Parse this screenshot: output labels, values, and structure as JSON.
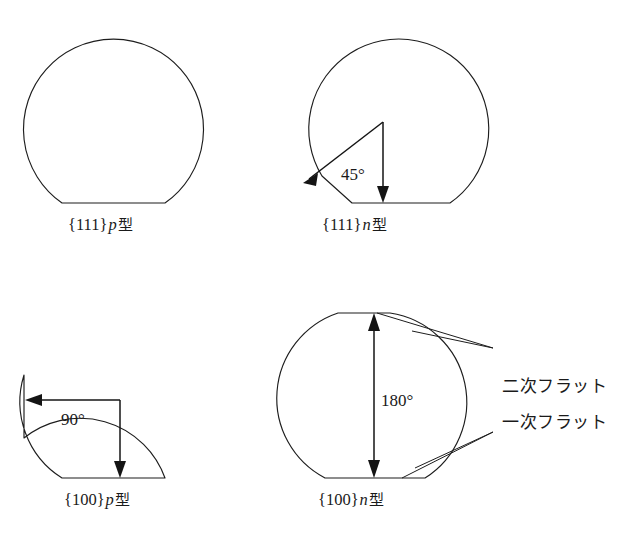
{
  "figure": {
    "background_color": "#ffffff",
    "line_color": "#1d1d1d"
  },
  "wafers": [
    {
      "id": "wafer-111-p",
      "caption_plane": "{111}",
      "caption_type": "p",
      "caption_suffix": "型",
      "angle_label": "",
      "flats": [
        "primary"
      ]
    },
    {
      "id": "wafer-111-n",
      "caption_plane": "{111}",
      "caption_type": "n",
      "caption_suffix": "型",
      "angle_label": "45°",
      "flats": [
        "primary",
        "secondary"
      ]
    },
    {
      "id": "wafer-100-p",
      "caption_plane": "{100}",
      "caption_type": "p",
      "caption_suffix": "型",
      "angle_label": "90°",
      "flats": [
        "primary",
        "secondary"
      ]
    },
    {
      "id": "wafer-100-n",
      "caption_plane": "{100}",
      "caption_type": "n",
      "caption_suffix": "型",
      "angle_label": "180°",
      "flats": [
        "primary",
        "secondary"
      ]
    }
  ],
  "callouts": {
    "secondary_flat": "二次フラット",
    "primary_flat": "一次フラット"
  }
}
